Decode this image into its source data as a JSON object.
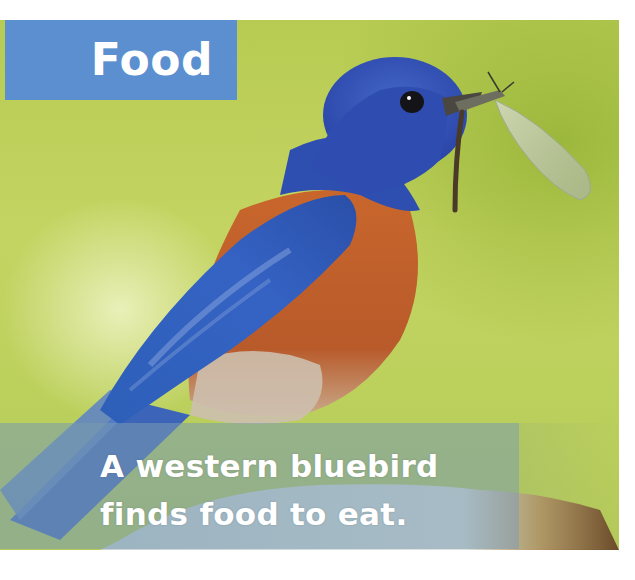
{
  "page": {
    "section_title": "Food",
    "caption_lines": [
      "A western bluebird",
      "finds food to eat."
    ]
  },
  "photo": {
    "subject": "western bluebird holding an insect in its beak",
    "background_color": "#bcd05c"
  },
  "colors": {
    "title_box": "#5b8fcf",
    "title_text": "#ffffff",
    "caption_band": "#789baf",
    "caption_text": "#ffffff",
    "bird_blue": "#2f4fb0",
    "bird_orange": "#c0622a"
  }
}
